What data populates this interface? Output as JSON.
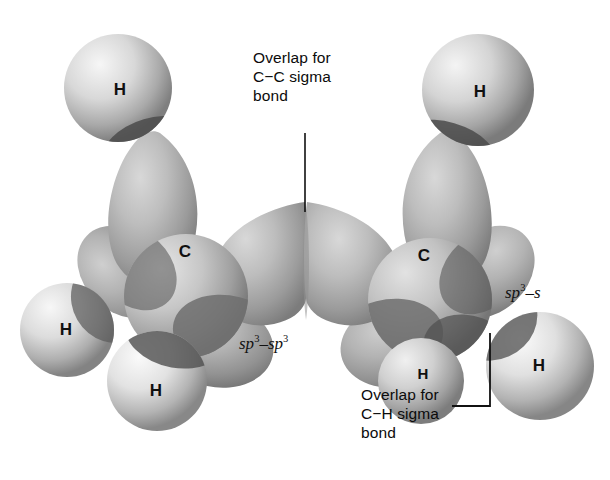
{
  "figure": {
    "type": "orbital-overlap",
    "background_color": "#ffffff",
    "ink_color": "#0b0b0b"
  },
  "callouts": [
    {
      "id": "cc-sigma",
      "text": "Overlap for\nC−C sigma\nbond",
      "x": 253,
      "y": 48,
      "leader": {
        "type": "line",
        "x1": 305,
        "y1": 133,
        "x2": 305,
        "y2": 212
      }
    },
    {
      "id": "ch-sigma",
      "text": "Overlap for\nC−H sigma\nbond",
      "x": 361,
      "y": 385,
      "leader": {
        "type": "bracket",
        "x": 490,
        "y_top": 333,
        "y_bottom": 406,
        "x_end": 452
      }
    }
  ],
  "orbital_labels": [
    {
      "id": "sp3-sp3",
      "base": "sp",
      "exp": "3",
      "mid": "–sp",
      "exp2": "3",
      "x": 239,
      "y": 333
    },
    {
      "id": "sp3-s",
      "base": "sp",
      "exp": "3",
      "mid": "–s",
      "exp2": "",
      "x": 505,
      "y": 282
    }
  ],
  "atoms": [
    {
      "id": "carbon-left",
      "label": "C",
      "x": 185,
      "y": 252,
      "size": "normal"
    },
    {
      "id": "carbon-right",
      "label": "C",
      "x": 424,
      "y": 256,
      "size": "normal"
    },
    {
      "id": "hydrogen-top-left",
      "label": "H",
      "x": 120,
      "y": 90,
      "size": "normal"
    },
    {
      "id": "hydrogen-top-right",
      "label": "H",
      "x": 480,
      "y": 92,
      "size": "normal"
    },
    {
      "id": "hydrogen-left",
      "label": "H",
      "x": 66,
      "y": 330,
      "size": "normal"
    },
    {
      "id": "hydrogen-bottom-left",
      "label": "H",
      "x": 156,
      "y": 391,
      "size": "normal"
    },
    {
      "id": "hydrogen-bottom-right",
      "label": "H",
      "x": 423,
      "y": 373,
      "size": "small"
    },
    {
      "id": "hydrogen-right",
      "label": "H",
      "x": 539,
      "y": 366,
      "size": "normal"
    }
  ],
  "spheres": [
    {
      "id": "h-sphere-top-left",
      "cx": 118,
      "cy": 88,
      "r": 54,
      "hx": 0.33,
      "hy": 0.28,
      "light": "#f3f3f3",
      "mid": "#c9c9c9",
      "dark": "#8d8d8d"
    },
    {
      "id": "h-sphere-top-right",
      "cx": 478,
      "cy": 90,
      "r": 56,
      "hx": 0.3,
      "hy": 0.28,
      "light": "#f2f2f2",
      "mid": "#c6c6c6",
      "dark": "#8a8a8a"
    },
    {
      "id": "h-sphere-left",
      "cx": 67,
      "cy": 330,
      "r": 47,
      "hx": 0.32,
      "hy": 0.26,
      "light": "#f4f4f4",
      "mid": "#cdcdcd",
      "dark": "#909090"
    },
    {
      "id": "h-sphere-bottom-left",
      "cx": 157,
      "cy": 381,
      "r": 50,
      "hx": 0.32,
      "hy": 0.26,
      "light": "#f6f6f6",
      "mid": "#d2d2d2",
      "dark": "#949494"
    },
    {
      "id": "h-sphere-bottom-right",
      "cx": 421,
      "cy": 381,
      "r": 43,
      "hx": 0.32,
      "hy": 0.26,
      "light": "#efefef",
      "mid": "#c4c4c4",
      "dark": "#8a8a8a"
    },
    {
      "id": "h-sphere-right",
      "cx": 540,
      "cy": 366,
      "r": 54,
      "hx": 0.32,
      "hy": 0.26,
      "light": "#f6f6f6",
      "mid": "#d0d0d0",
      "dark": "#8f8f8f"
    },
    {
      "id": "c-sphere-left",
      "cx": 186,
      "cy": 296,
      "r": 62,
      "hx": 0.3,
      "hy": 0.28,
      "light": "#e0e0e0",
      "mid": "#b8b8b8",
      "dark": "#848484"
    },
    {
      "id": "c-sphere-right",
      "cx": 430,
      "cy": 300,
      "r": 62,
      "hx": 0.3,
      "hy": 0.28,
      "light": "#dcdcdc",
      "mid": "#b4b4b4",
      "dark": "#808080"
    }
  ],
  "lobes": [
    {
      "id": "lobe-c-left-up",
      "cx": 152,
      "cy": 196,
      "rx": 48,
      "ry": 62,
      "rot": -18
    },
    {
      "id": "lobe-c-right-up",
      "cx": 446,
      "cy": 196,
      "rx": 48,
      "ry": 62,
      "rot": 18
    },
    {
      "id": "lobe-sp3-left",
      "cx": 251,
      "cy": 258,
      "rx": 62,
      "ry": 60,
      "rot": 0
    },
    {
      "id": "lobe-sp3-right",
      "cx": 360,
      "cy": 258,
      "rx": 62,
      "ry": 60,
      "rot": 0
    },
    {
      "id": "lobe-c-left-back",
      "cx": 120,
      "cy": 268,
      "rx": 40,
      "ry": 50,
      "rot": -48
    },
    {
      "id": "lobe-c-right-back",
      "cx": 485,
      "cy": 268,
      "rx": 40,
      "ry": 50,
      "rot": 48
    },
    {
      "id": "lobe-c-left-down",
      "cx": 214,
      "cy": 345,
      "rx": 56,
      "ry": 42,
      "rot": 10
    },
    {
      "id": "lobe-c-right-down",
      "cx": 400,
      "cy": 345,
      "rx": 56,
      "ry": 42,
      "rot": -10
    }
  ]
}
